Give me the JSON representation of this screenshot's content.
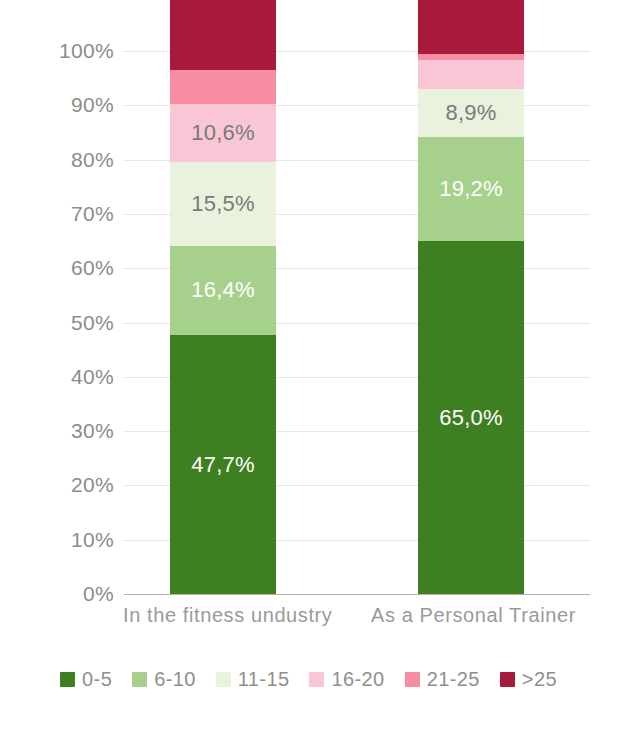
{
  "chart_data": {
    "type": "bar",
    "subtype": "stacked-percent-column",
    "title": "",
    "xlabel": "",
    "ylabel": "",
    "ylim": [
      0,
      100
    ],
    "ytick_labels": [
      "100%",
      "90%",
      "80%",
      "70%",
      "60%",
      "50%",
      "40%",
      "30%",
      "20%",
      "10%",
      "0%"
    ],
    "ytick_values": [
      100,
      90,
      80,
      70,
      60,
      50,
      40,
      30,
      20,
      10,
      0
    ],
    "grid": true,
    "legend_position": "bottom",
    "categories": [
      "In the fitness undustry",
      "As a Personal Trainer"
    ],
    "series": [
      {
        "name": "0-5",
        "color": "#3E8021",
        "values": [
          47.7,
          65.0
        ],
        "labels": [
          "47,7%",
          "65,0%"
        ],
        "label_visible": [
          true,
          true
        ],
        "label_color": [
          "light",
          "light"
        ]
      },
      {
        "name": "6-10",
        "color": "#A8D08D",
        "values": [
          16.4,
          19.2
        ],
        "labels": [
          "16,4%",
          "19,2%"
        ],
        "label_visible": [
          true,
          true
        ],
        "label_color": [
          "light",
          "light"
        ]
      },
      {
        "name": "11-15",
        "color": "#E8F2DC",
        "values": [
          15.5,
          8.9
        ],
        "labels": [
          "15,5%",
          "8,9%"
        ],
        "label_visible": [
          true,
          true
        ],
        "label_color": [
          "dark",
          "dark"
        ]
      },
      {
        "name": "16-20",
        "color": "#F9C6D5",
        "values": [
          10.6,
          5.2
        ],
        "labels": [
          "10,6%",
          "5,2%"
        ],
        "label_visible": [
          true,
          false
        ],
        "label_color": [
          "dark",
          "dark"
        ]
      },
      {
        "name": "21-25",
        "color": "#F78DA0",
        "values": [
          6.3,
          1.2
        ],
        "labels": [
          "6,3%",
          "1,2%"
        ],
        "label_visible": [
          false,
          false
        ],
        "label_color": [
          "light",
          "light"
        ]
      },
      {
        "name": ">25",
        "color": "#A81A3C",
        "values": [
          3.5,
          0.5
        ],
        "labels": [
          "3,5%",
          "0,5%"
        ],
        "label_visible": [
          false,
          false
        ],
        "label_color": [
          "light",
          "light"
        ]
      }
    ]
  },
  "legend": {
    "items": [
      {
        "label": "0-5",
        "color": "#3E8021"
      },
      {
        "label": "6-10",
        "color": "#A8D08D"
      },
      {
        "label": "11-15",
        "color": "#E8F2DC"
      },
      {
        "label": "16-20",
        "color": "#F9C6D5"
      },
      {
        "label": "21-25",
        "color": "#F78DA0"
      },
      {
        "label": ">25",
        "color": "#A81A3C"
      }
    ]
  }
}
